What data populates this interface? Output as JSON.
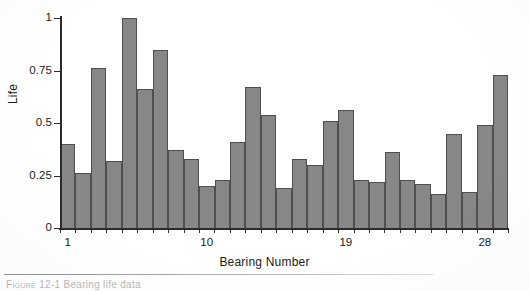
{
  "figure": {
    "caption_label": "Figure 12-1",
    "caption_text": "Bearing life data",
    "background_color": "#ffffff"
  },
  "chart_data": {
    "type": "bar",
    "title": "",
    "xlabel": "Bearing Number",
    "ylabel": "Life",
    "ylim": [
      0,
      1
    ],
    "grid": false,
    "legend": null,
    "bar_color": "#878787",
    "bar_edge_color": "#4f4f4f",
    "axis_color": "#2b2b2b",
    "ytick_labels": [
      "1",
      "0.75",
      "0.5",
      "0.25",
      "0"
    ],
    "ytick_values": [
      1,
      0.75,
      0.5,
      0.25,
      0
    ],
    "xtick_labels": [
      "1",
      "10",
      "19",
      "28"
    ],
    "xtick_values": [
      1,
      10,
      19,
      28
    ],
    "categories": [
      1,
      2,
      3,
      4,
      5,
      6,
      7,
      8,
      9,
      10,
      11,
      12,
      13,
      14,
      15,
      16,
      17,
      18,
      19,
      20,
      21,
      22,
      23,
      24,
      25,
      26,
      27,
      28,
      29
    ],
    "values": [
      0.4,
      0.26,
      0.76,
      0.32,
      1.0,
      0.66,
      0.85,
      0.37,
      0.33,
      0.2,
      0.23,
      0.41,
      0.67,
      0.54,
      0.19,
      0.33,
      0.3,
      0.51,
      0.56,
      0.23,
      0.22,
      0.36,
      0.23,
      0.21,
      0.16,
      0.45,
      0.17,
      0.49,
      0.73
    ]
  }
}
